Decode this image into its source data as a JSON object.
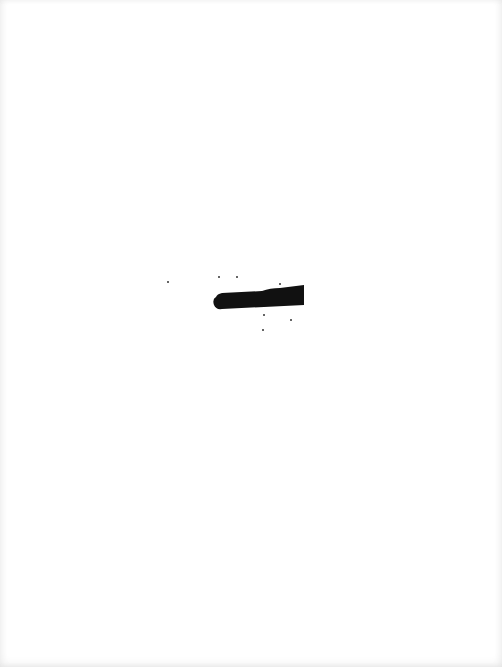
{
  "page": {
    "type": "scanned-blank-page",
    "background_color": "#ffffff",
    "mark": {
      "kind": "marker-stroke",
      "color": "#111111"
    },
    "specks": [
      {
        "x": 218,
        "y": 276
      },
      {
        "x": 236,
        "y": 276
      },
      {
        "x": 279,
        "y": 283
      },
      {
        "x": 263,
        "y": 314
      },
      {
        "x": 290,
        "y": 319
      },
      {
        "x": 262,
        "y": 329
      },
      {
        "x": 167,
        "y": 281
      }
    ]
  }
}
